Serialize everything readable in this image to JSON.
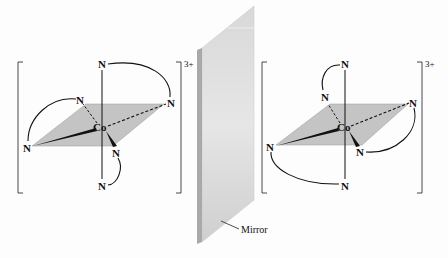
{
  "figure": {
    "colors": {
      "plane": "#c4c4c4",
      "mirror_face": "#d2d2d2",
      "mirror_edge": "#a8a8a8",
      "bond": "#111111"
    }
  },
  "left_complex": {
    "metal": "Co",
    "charge": "3+",
    "ligand_atoms": [
      "N",
      "N",
      "N",
      "N",
      "N",
      "N"
    ]
  },
  "right_complex": {
    "metal": "Co",
    "charge": "3+",
    "ligand_atoms": [
      "N",
      "N",
      "N",
      "N",
      "N",
      "N"
    ]
  },
  "mirror": {
    "label": "Mirror"
  }
}
